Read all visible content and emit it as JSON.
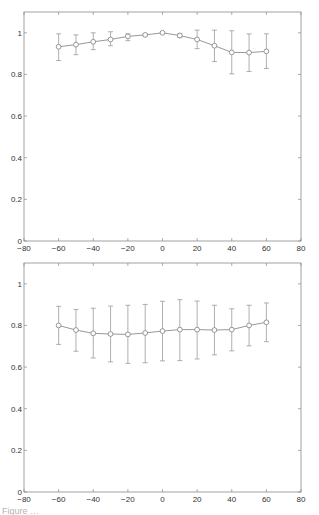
{
  "figure": {
    "caption_partial": "Figure …"
  },
  "style": {
    "axis_color": "#8a8a8a",
    "line_color": "#8c8c8c",
    "marker_color": "#8c8c8c",
    "errorbar_color": "#9a9a9a",
    "text_color": "#333333"
  },
  "chart_data": [
    {
      "type": "line",
      "title": "",
      "xlabel": "",
      "ylabel": "",
      "xlim": [
        -80,
        80
      ],
      "ylim": [
        0,
        1.1
      ],
      "xticks": [
        -80,
        -60,
        -40,
        -20,
        0,
        20,
        40,
        60,
        80
      ],
      "yticks": [
        0,
        0.2,
        0.4,
        0.6,
        0.8,
        1
      ],
      "ytick_labels": [
        "0",
        "0.2",
        "0.4",
        "0.6",
        "0.8",
        "1"
      ],
      "grid": false,
      "legend": null,
      "marker": "open-circle",
      "error_bars": true,
      "x": [
        -60,
        -50,
        -40,
        -30,
        -20,
        -10,
        0,
        10,
        20,
        30,
        40,
        50,
        60
      ],
      "series": [
        {
          "name": "top",
          "values": [
            0.933,
            0.943,
            0.957,
            0.968,
            0.983,
            0.99,
            1.0,
            0.987,
            0.968,
            0.938,
            0.906,
            0.905,
            0.911
          ],
          "err_upper": [
            0.995,
            0.99,
            1.0,
            1.005,
            0.995,
            0.995,
            1.0,
            0.997,
            1.013,
            1.013,
            1.01,
            0.995,
            0.995
          ],
          "err_lower": [
            0.867,
            0.895,
            0.919,
            0.938,
            0.962,
            0.985,
            1.0,
            0.977,
            0.924,
            0.862,
            0.803,
            0.814,
            0.829
          ]
        }
      ]
    },
    {
      "type": "line",
      "title": "",
      "xlabel": "",
      "ylabel": "",
      "xlim": [
        -80,
        80
      ],
      "ylim": [
        0,
        1.1
      ],
      "xticks": [
        -80,
        -60,
        -40,
        -20,
        0,
        20,
        40,
        60,
        80
      ],
      "yticks": [
        0,
        0.2,
        0.4,
        0.6,
        0.8,
        1
      ],
      "ytick_labels": [
        "0",
        "0.2",
        "0.4",
        "0.6",
        "0.8",
        "1"
      ],
      "grid": false,
      "legend": null,
      "marker": "open-circle",
      "error_bars": true,
      "x": [
        -60,
        -50,
        -40,
        -30,
        -20,
        -10,
        0,
        10,
        20,
        30,
        40,
        50,
        60
      ],
      "series": [
        {
          "name": "bottom",
          "values": [
            0.8,
            0.778,
            0.762,
            0.759,
            0.757,
            0.764,
            0.773,
            0.78,
            0.78,
            0.778,
            0.78,
            0.8,
            0.815
          ],
          "err_upper": [
            0.892,
            0.877,
            0.883,
            0.893,
            0.897,
            0.901,
            0.916,
            0.924,
            0.917,
            0.897,
            0.88,
            0.897,
            0.908
          ],
          "err_lower": [
            0.709,
            0.676,
            0.644,
            0.625,
            0.618,
            0.621,
            0.63,
            0.631,
            0.639,
            0.659,
            0.678,
            0.702,
            0.722
          ]
        }
      ]
    }
  ]
}
